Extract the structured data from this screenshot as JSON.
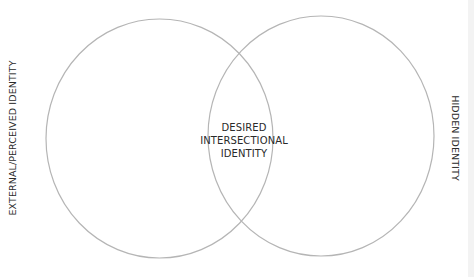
{
  "diagram": {
    "type": "venn",
    "circles": [
      {
        "id": "left",
        "label": "EXTERNAL/PERCEIVED IDENTITY",
        "cx": 159.5,
        "cy": 138.5,
        "rx": 113.5,
        "ry": 119.5
      },
      {
        "id": "right",
        "label": "HIDDEN IDENTITY",
        "cx": 321,
        "cy": 136,
        "rx": 113,
        "ry": 120
      }
    ],
    "intersection": {
      "lines": [
        "DESIRED",
        "INTERSECTIONAL",
        "IDENTITY"
      ]
    },
    "colors": {
      "stroke": "#b5b5b5",
      "text": "#2a2a2a",
      "background": "#ffffff"
    }
  }
}
